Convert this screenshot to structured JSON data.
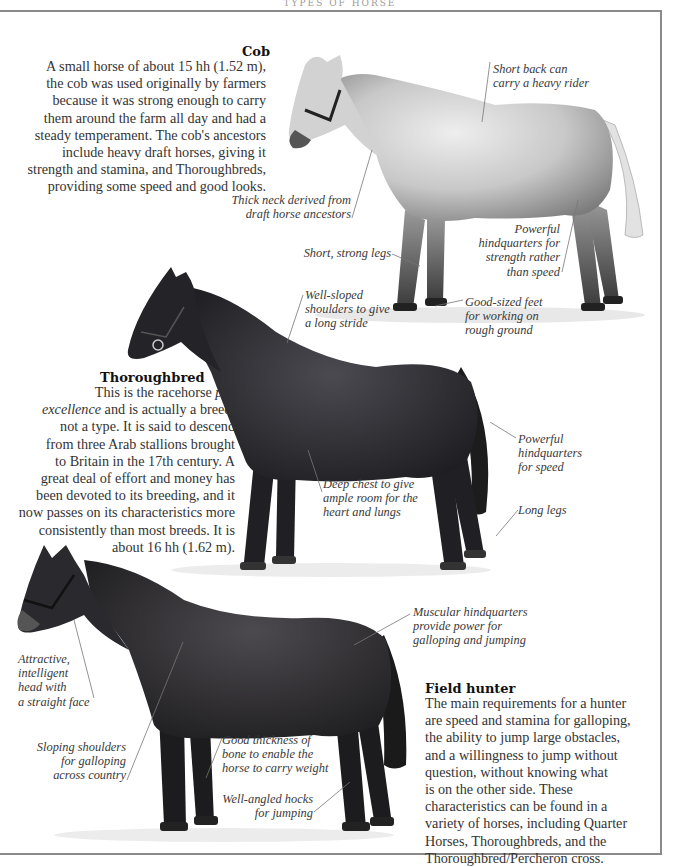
{
  "page": {
    "running_head": "TYPES OF HORSE"
  },
  "sections": [
    {
      "id": "cob",
      "title": "Cob",
      "body": "A small horse of about 15 hh (1.52 m),\nthe cob was used originally by farmers\nbecause it was strong enough to carry\nthem around the farm all day and had a\nsteady temperament. The cob's ancestors\ninclude heavy draft horses, giving it\nstrength and stamina, and Thoroughbreds,\nproviding some speed and good looks.",
      "horse_coat": "dapple grey",
      "captions": [
        "Short back can\ncarry a heavy rider",
        "Thick neck derived from\ndraft horse ancestors",
        "Short, strong legs",
        "Powerful\nhindquarters for\nstrength rather\nthan speed",
        "Good-sized feet\nfor working on\nrough ground"
      ]
    },
    {
      "id": "thoroughbred",
      "title": "Thoroughbred",
      "body_line1_pre": "This is the racehorse ",
      "body_line1_em": "par",
      "body_line2_em": "excellence",
      "body_rest": " and is actually a breed,\nnot a type. It is said to descend\nfrom three Arab stallions brought\nto Britain in the 17th century. A\ngreat deal of effort and money has\nbeen devoted to its breeding, and it\nnow passes on its characteristics more\nconsistently than most breeds. It is\nabout 16 hh (1.62 m).",
      "horse_coat": "dark bay",
      "captions": [
        "Well-sloped\nshoulders to give\na long stride",
        "Deep chest to give\nample room for the\nheart and lungs",
        "Powerful\nhindquarters\nfor speed",
        "Long legs"
      ]
    },
    {
      "id": "field-hunter",
      "title": "Field hunter",
      "body": "The main requirements for a hunter\nare speed and stamina for galloping,\nthe ability to jump large obstacles,\nand a willingness to jump without\nquestion, without knowing what\nis on the other side. These\ncharacteristics can be found in a\nvariety of horses, including Quarter\nHorses, Thoroughbreds, and the\nThoroughbred/Percheron cross.",
      "horse_coat": "dark brown",
      "captions": [
        "Muscular hindquarters\nprovide power for\ngalloping and jumping",
        "Attractive,\nintelligent\nhead with\na straight face",
        "Sloping shoulders\nfor galloping\nacross country",
        "Good thickness of\nbone to enable the\nhorse to carry weight",
        "Well-angled hocks\nfor jumping"
      ]
    }
  ],
  "colors": {
    "frame": "#8a8a8a",
    "text": "#333333",
    "caption": "#3a3a3a",
    "grey_horse": "#b9b9b9",
    "dark_horse": "#2a2a2e"
  }
}
